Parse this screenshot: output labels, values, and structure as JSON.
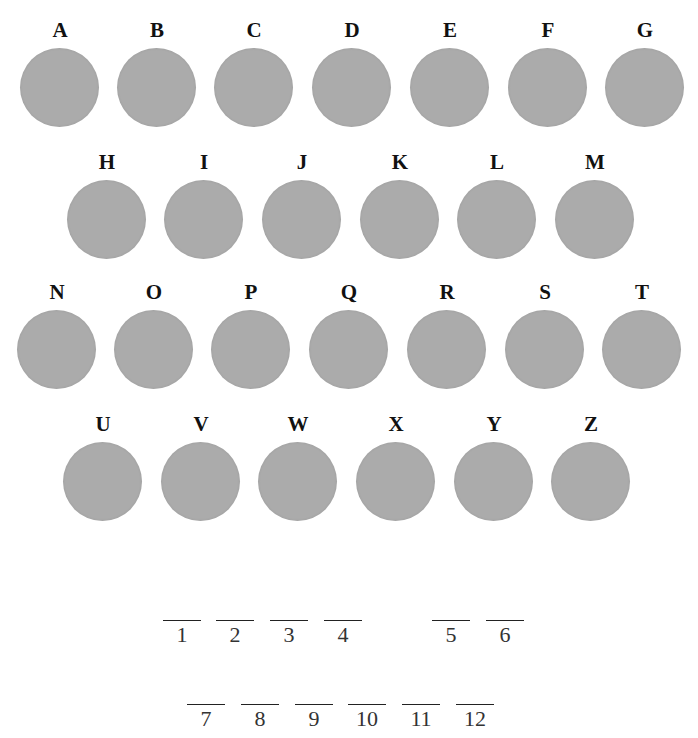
{
  "disc_color": "#ababab",
  "rows": [
    [
      "A",
      "B",
      "C",
      "D",
      "E",
      "F",
      "G"
    ],
    [
      "H",
      "I",
      "J",
      "K",
      "L",
      "M"
    ],
    [
      "N",
      "O",
      "P",
      "Q",
      "R",
      "S",
      "T"
    ],
    [
      "U",
      "V",
      "W",
      "X",
      "Y",
      "Z"
    ]
  ],
  "letters": {
    "A": "A",
    "B": "B",
    "C": "C",
    "D": "D",
    "E": "E",
    "F": "F",
    "G": "G",
    "H": "H",
    "I": "I",
    "J": "J",
    "K": "K",
    "L": "L",
    "M": "M",
    "N": "N",
    "O": "O",
    "P": "P",
    "Q": "Q",
    "R": "R",
    "S": "S",
    "T": "T",
    "U": "U",
    "V": "V",
    "W": "W",
    "X": "X",
    "Y": "Y",
    "Z": "Z"
  },
  "answer_blanks": {
    "row1": [
      "1",
      "2",
      "3",
      "4",
      "5",
      "6"
    ],
    "row2": [
      "7",
      "8",
      "9",
      "10",
      "11",
      "12"
    ]
  }
}
